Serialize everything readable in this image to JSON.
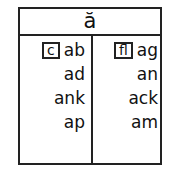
{
  "header": {
    "title": "ă"
  },
  "columns": [
    {
      "tag": "c",
      "items": [
        "ab",
        "ad",
        "ank",
        "ap"
      ]
    },
    {
      "tag": "fl",
      "items": [
        "ag",
        "an",
        "ack",
        "am"
      ]
    }
  ]
}
